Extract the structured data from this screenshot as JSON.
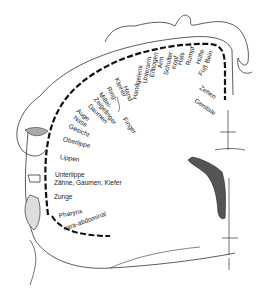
{
  "diagram": {
    "title": "",
    "type": "sensory homunculus (cortex cross-section)",
    "labels": [
      {
        "id": "zehen",
        "text": "Zehen",
        "x": 200,
        "y": 84,
        "rot": 35
      },
      {
        "id": "genitale",
        "text": "Genitale",
        "x": 195,
        "y": 97,
        "rot": 35
      },
      {
        "id": "fuss",
        "text": "Fuß",
        "x": 200,
        "y": 72,
        "rot": -55
      },
      {
        "id": "bein",
        "text": "Bein",
        "x": 207,
        "y": 60,
        "rot": -70
      },
      {
        "id": "huefte",
        "text": "Hüfte",
        "x": 198,
        "y": 61,
        "rot": -72
      },
      {
        "id": "rumpf",
        "text": "Rumpf",
        "x": 188,
        "y": 62,
        "rot": -75
      },
      {
        "id": "hals",
        "text": "Hals",
        "x": 180,
        "y": 62,
        "rot": -78
      },
      {
        "id": "kopf",
        "text": "Kopf",
        "x": 174,
        "y": 66,
        "rot": -78
      },
      {
        "id": "schulter",
        "text": "Schulter",
        "x": 166,
        "y": 72,
        "rot": -78
      },
      {
        "id": "arm",
        "text": "Arm",
        "x": 160,
        "y": 65,
        "rot": -80
      },
      {
        "id": "ellbogen",
        "text": "Ellbogen",
        "x": 152,
        "y": 74,
        "rot": -80
      },
      {
        "id": "unterarm",
        "text": "Unterarm",
        "x": 145,
        "y": 80,
        "rot": -80
      },
      {
        "id": "handgelenk",
        "text": "Handgelenk",
        "x": 135,
        "y": 96,
        "rot": -80
      },
      {
        "id": "hand",
        "text": "Hand",
        "x": 125,
        "y": 83,
        "rot": 70
      },
      {
        "id": "kleiner",
        "text": "Kleiner",
        "x": 116,
        "y": 75,
        "rot": 65
      },
      {
        "id": "ring",
        "text": "Ring-",
        "x": 108,
        "y": 84,
        "rot": 60
      },
      {
        "id": "mittel",
        "text": "Mittel-",
        "x": 100,
        "y": 90,
        "rot": 55
      },
      {
        "id": "zeigefinger",
        "text": "Zeigefinger",
        "x": 95,
        "y": 95,
        "rot": 52
      },
      {
        "id": "finger",
        "text": "Finger",
        "x": 124,
        "y": 115,
        "rot": 55
      },
      {
        "id": "daumen",
        "text": "Daumen",
        "x": 89,
        "y": 102,
        "rot": 45
      },
      {
        "id": "auge",
        "text": "Auge",
        "x": 77,
        "y": 107,
        "rot": 40
      },
      {
        "id": "nase",
        "text": "Nase",
        "x": 74,
        "y": 114,
        "rot": 35
      },
      {
        "id": "gesicht",
        "text": "Gesicht",
        "x": 69,
        "y": 123,
        "rot": 25
      },
      {
        "id": "oberlippe",
        "text": "Oberlippe",
        "x": 63,
        "y": 136,
        "rot": 15
      },
      {
        "id": "lippen",
        "text": "Lippen",
        "x": 60,
        "y": 154,
        "rot": 8
      },
      {
        "id": "unterlippe",
        "text": "Unterlippe",
        "x": 55,
        "y": 172,
        "rot": 0
      },
      {
        "id": "zaehne",
        "text": "Zähne, Gaumen, Kiefer",
        "x": 54,
        "y": 180,
        "rot": 0
      },
      {
        "id": "zunge",
        "text": "Zunge",
        "x": 54,
        "y": 194,
        "rot": 0
      },
      {
        "id": "pharynx",
        "text": "Pharynx",
        "x": 59,
        "y": 213,
        "rot": -12
      },
      {
        "id": "intra",
        "text": "intra-abdominal",
        "x": 64,
        "y": 226,
        "rot": -20
      }
    ]
  }
}
